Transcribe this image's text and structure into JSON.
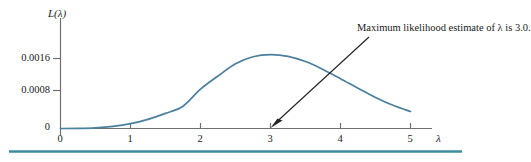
{
  "figure": {
    "name": "likelihood-function-plot",
    "y_axis_label": "L(λ)",
    "x_axis_label": "λ",
    "annotation": "Maximum likelihood estimate of λ is 3.0.",
    "curve_color": "#4a7f9e",
    "axis_color": "#6f6f6f",
    "rule_color": "#3f8ca0",
    "arrow_color": "#232323"
  },
  "chart_data": {
    "type": "line",
    "title": "",
    "subtitle": "",
    "xlabel": "λ",
    "ylabel": "L(λ)",
    "xlim": [
      0,
      5.2
    ],
    "ylim": [
      0,
      0.002
    ],
    "grid": false,
    "legend": null,
    "xticks": [
      0,
      1,
      2,
      3,
      4,
      5
    ],
    "xtick_labels": [
      "0",
      "1",
      "2",
      "3",
      "4",
      "5"
    ],
    "yticks": [
      0,
      0.0008,
      0.0016
    ],
    "ytick_labels": [
      "0",
      "0.0008",
      "0.0016"
    ],
    "annotations": [
      {
        "text": "Maximum likelihood estimate of λ is 3.0.",
        "points_to_x": 3.0,
        "points_to_y": 0.0
      }
    ],
    "series": [
      {
        "name": "L(λ)",
        "color": "#4a7f9e",
        "x": [
          0.0,
          0.25,
          0.5,
          0.75,
          1.0,
          1.25,
          1.5,
          1.75,
          2.0,
          2.25,
          2.5,
          2.75,
          3.0,
          3.25,
          3.5,
          3.75,
          4.0,
          4.25,
          4.5,
          4.75,
          5.0
        ],
        "y": [
          0.0,
          2e-06,
          1.4e-05,
          4.7e-05,
          0.00011,
          0.00021,
          0.000345,
          0.00051,
          0.0009,
          0.0012,
          0.00148,
          0.00164,
          0.00169,
          0.00165,
          0.00153,
          0.00135,
          0.00114,
          0.00092,
          0.00071,
          0.00053,
          0.00039
        ]
      }
    ],
    "max_point": {
      "x": 3.0,
      "y": 0.00169
    }
  }
}
